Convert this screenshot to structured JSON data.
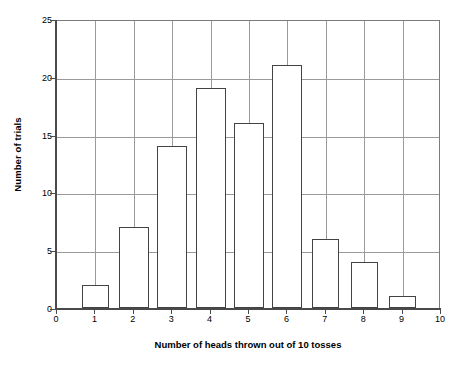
{
  "chart_data": {
    "type": "bar",
    "title": "",
    "subtitle": "",
    "xlabel": "Number of heads thrown out of 10 tosses",
    "ylabel": "Number of trials",
    "categories": [
      "0",
      "1",
      "2",
      "3",
      "4",
      "5",
      "6",
      "7",
      "8",
      "9",
      "10"
    ],
    "values": [
      0,
      2,
      7,
      14,
      19,
      16,
      21,
      6,
      4,
      1,
      0
    ],
    "xlim": [
      0,
      10
    ],
    "ylim": [
      0,
      25
    ],
    "y_ticks": [
      0,
      5,
      10,
      15,
      20,
      25
    ],
    "y_tick_labels": [
      "0",
      "5",
      "10",
      "15",
      "20",
      "25"
    ],
    "x_ticks": [
      0,
      1,
      2,
      3,
      4,
      5,
      6,
      7,
      8,
      9,
      10
    ],
    "x_tick_labels": [
      "0",
      "1",
      "2",
      "3",
      "4",
      "5",
      "6",
      "7",
      "8",
      "9",
      "10"
    ],
    "grid": {
      "horizontal": true,
      "vertical": true,
      "color": "#9a9a9a"
    },
    "legend": {
      "visible": false,
      "entries": []
    },
    "annotations": [],
    "series": [
      {
        "name": "Number of trials",
        "values": [
          0,
          2,
          7,
          14,
          19,
          16,
          21,
          6,
          4,
          1,
          0
        ],
        "bar_fill": "#ffffff",
        "bar_border": "#434343"
      }
    ],
    "bar_widths_px": [
      0,
      27,
      30,
      30,
      30,
      30,
      30,
      27,
      27,
      27,
      0
    ],
    "total_trials": 90,
    "plot_background": "#ffffff",
    "axis_color": "#4a4a4a"
  }
}
